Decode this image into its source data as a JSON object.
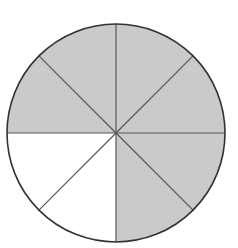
{
  "diagram": {
    "type": "fraction-circle",
    "total_slices": 8,
    "shaded_slices": 6,
    "unshaded_slices": 2,
    "fraction_shaded": "6/8",
    "shaded_color": "#cacaca",
    "unshaded_color": "#ffffff",
    "line_color": "#555555",
    "center": [
      116,
      133
    ],
    "radius": 109,
    "slices": [
      {
        "index": 0,
        "position": "top-right upper",
        "shaded": true
      },
      {
        "index": 1,
        "position": "top-right lower",
        "shaded": true
      },
      {
        "index": 2,
        "position": "bottom-right upper",
        "shaded": true
      },
      {
        "index": 3,
        "position": "bottom-right lower",
        "shaded": true
      },
      {
        "index": 4,
        "position": "bottom-left lower",
        "shaded": false
      },
      {
        "index": 5,
        "position": "bottom-left upper",
        "shaded": false
      },
      {
        "index": 6,
        "position": "top-left lower",
        "shaded": true
      },
      {
        "index": 7,
        "position": "top-left upper",
        "shaded": true
      }
    ]
  }
}
